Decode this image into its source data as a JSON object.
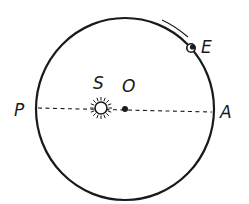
{
  "diagram": {
    "labels": {
      "sun": "S",
      "center": "O",
      "perihelion": "P",
      "aphelion": "A",
      "planet": "E"
    },
    "colors": {
      "stroke": "#1a1a1a",
      "background": "#ffffff"
    },
    "elements": [
      {
        "name": "orbit",
        "type": "ellipse"
      },
      {
        "name": "apsidal-line",
        "type": "dashed-line",
        "from": "P",
        "to": "A"
      },
      {
        "name": "sun",
        "type": "sun-symbol",
        "label": "S"
      },
      {
        "name": "center-point",
        "type": "dot",
        "label": "O"
      },
      {
        "name": "planet",
        "type": "dot",
        "label": "E"
      },
      {
        "name": "direction-arc",
        "type": "arc",
        "meaning": "direction of motion"
      }
    ]
  }
}
